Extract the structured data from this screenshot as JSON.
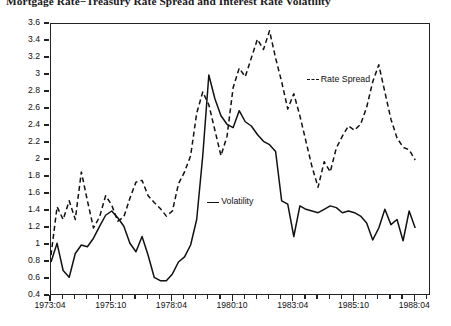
{
  "chart_data": {
    "type": "line",
    "title": "Mortgage Rate−Treasury Rate Spread and Interest Rate Volatility",
    "xlabel": "",
    "ylabel": "",
    "ylim": [
      0.4,
      3.6
    ],
    "ytick_step": 0.2,
    "grid": false,
    "legend_position": "inline-annotation",
    "x_tick_labels": [
      "1973:04",
      "1975:10",
      "1978:04",
      "1980:10",
      "1983:04",
      "1985:10",
      "1988:04"
    ],
    "x_tick_values": [
      1973.25,
      1975.75,
      1978.25,
      1980.75,
      1983.25,
      1985.75,
      1988.25
    ],
    "x_minor_per_major": 5,
    "xlim": [
      1973.25,
      1988.9
    ],
    "y_tick_labels": [
      "0.4",
      "0.6",
      "0.8",
      "1",
      "1.2",
      "1.4",
      "1.6",
      "1.8",
      "2",
      "2.2",
      "2.4",
      "2.6",
      "2.8",
      "3",
      "3.2",
      "3.4",
      "3.6"
    ],
    "series": [
      {
        "name": "Rate Spread",
        "style": "dashed",
        "color": "#111111",
        "x": [
          1973.25,
          1973.5,
          1973.75,
          1974.0,
          1974.25,
          1974.5,
          1974.75,
          1975.0,
          1975.25,
          1975.5,
          1975.75,
          1976.0,
          1976.25,
          1976.5,
          1976.75,
          1977.0,
          1977.25,
          1977.5,
          1977.75,
          1978.0,
          1978.25,
          1978.5,
          1978.75,
          1979.0,
          1979.25,
          1979.5,
          1979.75,
          1980.0,
          1980.25,
          1980.5,
          1980.75,
          1981.0,
          1981.25,
          1981.5,
          1981.75,
          1982.0,
          1982.25,
          1982.5,
          1982.75,
          1983.0,
          1983.25,
          1983.5,
          1983.75,
          1984.0,
          1984.25,
          1984.5,
          1984.75,
          1985.0,
          1985.25,
          1985.5,
          1985.75,
          1986.0,
          1986.25,
          1986.5,
          1986.75,
          1987.0,
          1987.25,
          1987.5,
          1987.75,
          1988.0,
          1988.25
        ],
        "values": [
          0.88,
          1.45,
          1.3,
          1.52,
          1.3,
          1.86,
          1.52,
          1.2,
          1.33,
          1.58,
          1.47,
          1.28,
          1.33,
          1.55,
          1.74,
          1.76,
          1.58,
          1.5,
          1.43,
          1.34,
          1.4,
          1.72,
          1.86,
          2.05,
          2.55,
          2.8,
          2.65,
          2.35,
          2.05,
          2.28,
          2.85,
          3.08,
          2.98,
          3.2,
          3.42,
          3.3,
          3.52,
          3.2,
          2.92,
          2.6,
          2.78,
          2.52,
          2.22,
          1.92,
          1.68,
          1.98,
          1.86,
          2.14,
          2.28,
          2.4,
          2.35,
          2.42,
          2.62,
          2.92,
          3.12,
          2.8,
          2.48,
          2.26,
          2.15,
          2.12,
          2.0
        ]
      },
      {
        "name": "Volatility",
        "style": "solid",
        "color": "#111111",
        "x": [
          1973.25,
          1973.5,
          1973.75,
          1974.0,
          1974.25,
          1974.5,
          1974.75,
          1975.0,
          1975.25,
          1975.5,
          1975.75,
          1976.0,
          1976.25,
          1976.5,
          1976.75,
          1977.0,
          1977.25,
          1977.5,
          1977.75,
          1978.0,
          1978.25,
          1978.5,
          1978.75,
          1979.0,
          1979.25,
          1979.5,
          1979.75,
          1980.0,
          1980.25,
          1980.5,
          1980.75,
          1981.0,
          1981.25,
          1981.5,
          1981.75,
          1982.0,
          1982.25,
          1982.5,
          1982.75,
          1983.0,
          1983.25,
          1983.5,
          1983.75,
          1984.0,
          1984.25,
          1984.5,
          1984.75,
          1985.0,
          1985.25,
          1985.5,
          1985.75,
          1986.0,
          1986.25,
          1986.5,
          1986.75,
          1987.0,
          1987.25,
          1987.5,
          1987.75,
          1988.0,
          1988.25
        ],
        "values": [
          0.8,
          1.02,
          0.7,
          0.62,
          0.9,
          1.0,
          0.98,
          1.08,
          1.22,
          1.35,
          1.4,
          1.32,
          1.22,
          1.02,
          0.92,
          1.1,
          0.88,
          0.62,
          0.58,
          0.58,
          0.66,
          0.8,
          0.86,
          1.0,
          1.3,
          2.05,
          3.0,
          2.72,
          2.52,
          2.42,
          2.38,
          2.58,
          2.45,
          2.4,
          2.3,
          2.22,
          2.18,
          2.1,
          1.52,
          1.48,
          1.1,
          1.46,
          1.42,
          1.4,
          1.38,
          1.42,
          1.46,
          1.44,
          1.38,
          1.4,
          1.38,
          1.34,
          1.26,
          1.06,
          1.2,
          1.42,
          1.24,
          1.3,
          1.05,
          1.4,
          1.2
        ]
      }
    ],
    "annotations": [
      {
        "text": "Rate Spread",
        "x": 1984.4,
        "y": 2.94,
        "key_style": "dashed"
      },
      {
        "text": "Volatility",
        "x": 1980.3,
        "y": 1.5,
        "key_style": "solid"
      }
    ]
  },
  "axes": {
    "y_ticks": [
      "3.6",
      "3.4",
      "3.2",
      "3",
      "2.8",
      "2.6",
      "2.4",
      "2.2",
      "2",
      "1.8",
      "1.6",
      "1.4",
      "1.2",
      "1",
      "0.8",
      "0.6",
      "0.4"
    ],
    "x_ticks": [
      "1973:04",
      "1975:10",
      "1978:04",
      "1980:10",
      "1983:04",
      "1985:10",
      "1988:04"
    ]
  }
}
